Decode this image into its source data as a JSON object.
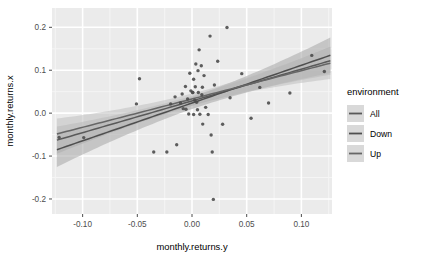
{
  "chart_data": {
    "type": "scatter",
    "title": "",
    "xlabel": "monthly.returns.y",
    "ylabel": "monthly.returns.x",
    "xlim": [
      -0.128,
      0.128
    ],
    "ylim": [
      -0.235,
      0.245
    ],
    "xticks": [
      -0.1,
      -0.05,
      0.0,
      0.05,
      0.1
    ],
    "xticklabels": [
      "-0.10",
      "-0.05",
      "0.00",
      "0.05",
      "0.10"
    ],
    "yticks": [
      -0.2,
      -0.1,
      0.0,
      0.1,
      0.2
    ],
    "yticklabels": [
      "-0.2",
      "-0.1",
      "0.0",
      "0.1",
      "0.2"
    ],
    "grid": true,
    "panel_background": "#EBEBEB",
    "grid_major_color": "#FFFFFF",
    "grid_minor_color": "#F5F5F5",
    "point_color": "#4D4D4D",
    "point_size": 1.7,
    "legend_position": "right",
    "points": [
      {
        "x": -0.1215,
        "y": -0.0565
      },
      {
        "x": -0.0508,
        "y": 0.0215
      },
      {
        "x": -0.035,
        "y": -0.0905
      },
      {
        "x": -0.023,
        "y": -0.0905
      },
      {
        "x": -0.014,
        "y": -0.0735
      },
      {
        "x": -0.0105,
        "y": 0.0235
      },
      {
        "x": -0.009,
        "y": 0.0445
      },
      {
        "x": -0.008,
        "y": 0.0105
      },
      {
        "x": -0.006,
        "y": 0.062
      },
      {
        "x": -0.0055,
        "y": 0.009
      },
      {
        "x": -0.004,
        "y": 0.033
      },
      {
        "x": -0.002,
        "y": 0.093
      },
      {
        "x": -0.001,
        "y": 0.052
      },
      {
        "x": 0.0005,
        "y": 0.048
      },
      {
        "x": 0.0008,
        "y": 0.048
      },
      {
        "x": 0.0015,
        "y": 0.079
      },
      {
        "x": 0.0025,
        "y": 0.03
      },
      {
        "x": 0.003,
        "y": 0.0615
      },
      {
        "x": 0.0035,
        "y": 0.1145
      },
      {
        "x": 0.0042,
        "y": 0.0255
      },
      {
        "x": 0.005,
        "y": 0.008
      },
      {
        "x": 0.0055,
        "y": 0.099
      },
      {
        "x": 0.0058,
        "y": 0.048
      },
      {
        "x": 0.0065,
        "y": 0.1475
      },
      {
        "x": 0.0072,
        "y": -0.0025
      },
      {
        "x": 0.0085,
        "y": 0.1105
      },
      {
        "x": 0.0095,
        "y": 0.0605
      },
      {
        "x": 0.0098,
        "y": -0.0255
      },
      {
        "x": 0.011,
        "y": 0.0875
      },
      {
        "x": 0.0125,
        "y": 0.0135
      },
      {
        "x": 0.0148,
        "y": -0.003
      },
      {
        "x": 0.0165,
        "y": 0.1795
      },
      {
        "x": 0.0175,
        "y": -0.051
      },
      {
        "x": 0.0185,
        "y": -0.0905
      },
      {
        "x": 0.0195,
        "y": -0.201
      },
      {
        "x": 0.0205,
        "y": 0.0655
      },
      {
        "x": 0.0235,
        "y": 0.121
      },
      {
        "x": 0.028,
        "y": -0.026
      },
      {
        "x": 0.032,
        "y": 0.1995
      },
      {
        "x": 0.0348,
        "y": 0.036
      },
      {
        "x": 0.0455,
        "y": 0.092
      },
      {
        "x": 0.054,
        "y": -0.012
      },
      {
        "x": 0.062,
        "y": 0.06
      },
      {
        "x": 0.07,
        "y": 0.0235
      },
      {
        "x": 0.0895,
        "y": 0.047
      },
      {
        "x": 0.1095,
        "y": 0.1345
      },
      {
        "x": 0.121,
        "y": 0.097
      },
      {
        "x": -0.048,
        "y": 0.08
      },
      {
        "x": -0.099,
        "y": -0.057
      },
      {
        "x": 0.0015,
        "y": -0.003
      },
      {
        "x": -0.0155,
        "y": 0.038
      },
      {
        "x": -0.003,
        "y": -0.002
      },
      {
        "x": 0.009,
        "y": 0.043
      },
      {
        "x": -0.0195,
        "y": 0.0215
      }
    ],
    "series": [
      {
        "name": "All",
        "line_color": "#595959",
        "band_color": "#B3B3B3",
        "intercept": 0.0285,
        "slope": 0.74,
        "x_start": -0.1235,
        "x_end": 0.1265,
        "se_at_center": 0.0115,
        "se_at_edge": 0.033
      },
      {
        "name": "Down",
        "line_color": "#4F4F4F",
        "band_color": "#A6A6A6",
        "intercept": 0.0235,
        "slope": 0.88,
        "x_start": -0.1235,
        "x_end": 0.1265,
        "se_at_center": 0.014,
        "se_at_edge": 0.042
      },
      {
        "name": "Up",
        "line_color": "#666666",
        "band_color": "#BFBFBF",
        "intercept": 0.033,
        "slope": 0.66,
        "x_start": -0.1235,
        "x_end": 0.1265,
        "se_at_center": 0.0125,
        "se_at_edge": 0.0375
      }
    ]
  },
  "legend": {
    "title": "environment",
    "items": [
      {
        "label": "All",
        "key_color": "#595959",
        "key_bg": "#D9D9D9"
      },
      {
        "label": "Down",
        "key_color": "#4F4F4F",
        "key_bg": "#D9D9D9"
      },
      {
        "label": "Up",
        "key_color": "#666666",
        "key_bg": "#D9D9D9"
      }
    ]
  }
}
